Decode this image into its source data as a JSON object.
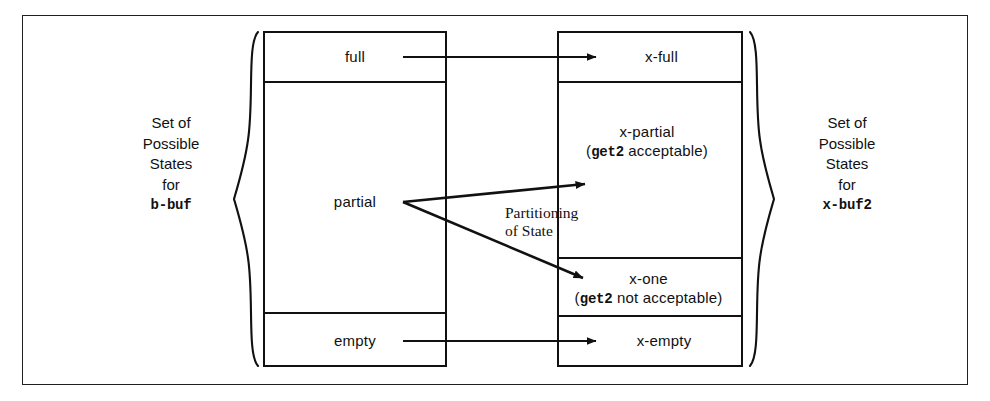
{
  "figure": {
    "background_color": "#ffffff",
    "line_color": "#111111"
  },
  "left_caption": {
    "line1": "Set of",
    "line2": "Possible",
    "line3": "States",
    "line4": "for",
    "name": "b-buf"
  },
  "right_caption": {
    "line1": "Set of",
    "line2": "Possible",
    "line3": "States",
    "line4": "for",
    "name": "x-buf2"
  },
  "left_box": {
    "label": "Set of Possible States for b-buf",
    "cells": [
      {
        "id": "full",
        "label": "full"
      },
      {
        "id": "partial",
        "label": "partial"
      },
      {
        "id": "empty",
        "label": "empty"
      }
    ]
  },
  "right_box": {
    "label": "Set of Possible States for x-buf2",
    "cells": [
      {
        "id": "x-full",
        "label": "x-full",
        "note": "",
        "note_mono": ""
      },
      {
        "id": "x-partial",
        "label": "x-partial",
        "note_mono": "get2",
        "note_rest": " acceptable)",
        "note_open": "("
      },
      {
        "id": "x-one",
        "label": "x-one",
        "note_mono": "get2",
        "note_rest": " not acceptable)",
        "note_open": "("
      },
      {
        "id": "x-empty",
        "label": "x-empty",
        "note": "",
        "note_mono": ""
      }
    ]
  },
  "partition_note": {
    "line1": "Partitioning",
    "line2": "of State"
  },
  "mappings": [
    {
      "from": "full",
      "to": "x-full"
    },
    {
      "from": "partial",
      "to": "x-partial"
    },
    {
      "from": "partial",
      "to": "x-one"
    },
    {
      "from": "empty",
      "to": "x-empty"
    }
  ],
  "braces": {
    "left": "{",
    "right": "}"
  }
}
